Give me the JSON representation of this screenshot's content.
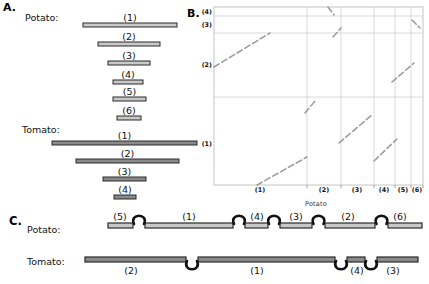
{
  "colors": {
    "potato_fill": "#c9c9c9",
    "tomato_fill": "#8a8a8a",
    "bar_outline": "#2a2a2a",
    "grid": "#d9d9d9",
    "frame": "#c4c4c4",
    "dash": "#999999",
    "loop": "#111111",
    "text": "#111111"
  },
  "panel_a": {
    "label": "A.",
    "potato_label": "Potato:",
    "tomato_label": "Tomato:",
    "bar_h": 4,
    "potato_bars": [
      {
        "label": "(1)",
        "x": 83,
        "w": 94,
        "y": 23
      },
      {
        "label": "(2)",
        "x": 98,
        "w": 62,
        "y": 42
      },
      {
        "label": "(3)",
        "x": 108,
        "w": 42,
        "y": 61
      },
      {
        "label": "(4)",
        "x": 113,
        "w": 30,
        "y": 80
      },
      {
        "label": "(5)",
        "x": 113,
        "w": 33,
        "y": 97
      },
      {
        "label": "(6)",
        "x": 117,
        "w": 24,
        "y": 116
      }
    ],
    "tomato_bars": [
      {
        "label": "(1)",
        "x": 52,
        "w": 145,
        "y": 141
      },
      {
        "label": "(2)",
        "x": 76,
        "w": 103,
        "y": 159
      },
      {
        "label": "(3)",
        "x": 103,
        "w": 43,
        "y": 177
      },
      {
        "label": "(4)",
        "x": 114,
        "w": 22,
        "y": 195
      }
    ]
  },
  "panel_b": {
    "label": "B.",
    "x_axis_label": "Potato",
    "plot": {
      "left": 214,
      "top": 7,
      "right": 423,
      "bottom": 185
    },
    "x_grid": [
      307,
      341,
      374,
      395,
      411
    ],
    "y_grid": [
      16,
      33,
      97
    ],
    "x_ticks": [
      {
        "label": "(1)",
        "x": 260
      },
      {
        "label": "(2)",
        "x": 324
      },
      {
        "label": "(3)",
        "x": 357
      },
      {
        "label": "(4)",
        "x": 384
      },
      {
        "label": "(5)",
        "x": 403
      },
      {
        "label": "(6)",
        "x": 417
      }
    ],
    "y_ticks": [
      {
        "label": "(4)",
        "y": 11
      },
      {
        "label": "(3)",
        "y": 24
      },
      {
        "label": "(2)",
        "y": 64
      },
      {
        "label": "(1)",
        "y": 143
      }
    ],
    "alignments": [
      {
        "x1": 214,
        "y1": 67,
        "x2": 270,
        "y2": 33,
        "orientation": "forward"
      },
      {
        "x1": 333,
        "y1": 37,
        "x2": 341,
        "y2": 28,
        "orientation": "forward"
      },
      {
        "x1": 328,
        "y1": 7,
        "x2": 334,
        "y2": 15,
        "orientation": "inverted"
      },
      {
        "x1": 412,
        "y1": 20,
        "x2": 420,
        "y2": 28,
        "orientation": "inverted"
      },
      {
        "x1": 392,
        "y1": 82,
        "x2": 414,
        "y2": 63,
        "orientation": "forward"
      },
      {
        "x1": 305,
        "y1": 113,
        "x2": 316,
        "y2": 100,
        "orientation": "forward"
      },
      {
        "x1": 339,
        "y1": 143,
        "x2": 373,
        "y2": 114,
        "orientation": "forward"
      },
      {
        "x1": 374,
        "y1": 161,
        "x2": 397,
        "y2": 139,
        "orientation": "forward"
      },
      {
        "x1": 257,
        "y1": 185,
        "x2": 307,
        "y2": 157,
        "orientation": "forward"
      }
    ]
  },
  "panel_c": {
    "label": "C.",
    "potato_label": "Potato:",
    "tomato_label": "Tomato:",
    "bar_h": 5,
    "potato": {
      "bar_y": 223,
      "label_baseline": 220,
      "segments": [
        {
          "label": "(5)",
          "x1": 108,
          "x2": 133,
          "label_x": 120
        },
        {
          "label": "(1)",
          "x1": 145,
          "x2": 233,
          "label_x": 189
        },
        {
          "label": "(4)",
          "x1": 245,
          "x2": 268,
          "label_x": 257
        },
        {
          "label": "(3)",
          "x1": 280,
          "x2": 312,
          "label_x": 296
        },
        {
          "label": "(2)",
          "x1": 325,
          "x2": 375,
          "label_x": 348
        },
        {
          "label": "(6)",
          "x1": 388,
          "x2": 422,
          "label_x": 400
        }
      ],
      "loops": [
        139,
        239,
        274,
        318.5,
        381.5
      ]
    },
    "tomato": {
      "bar_y": 257,
      "label_baseline": 274,
      "segments": [
        {
          "label": "(2)",
          "x1": 85,
          "x2": 186,
          "label_x": 131
        },
        {
          "label": "(1)",
          "x1": 198,
          "x2": 335,
          "label_x": 257
        },
        {
          "label": "(4)",
          "x1": 347,
          "x2": 365,
          "label_x": 357
        },
        {
          "label": "(3)",
          "x1": 377,
          "x2": 418,
          "label_x": 393
        }
      ],
      "loops": [
        192,
        341,
        371
      ]
    }
  },
  "chart_data": {
    "type": "scatter",
    "title": "",
    "xlabel": "Potato",
    "ylabel": "",
    "x_categories": [
      "(1)",
      "(2)",
      "(3)",
      "(4)",
      "(5)",
      "(6)"
    ],
    "y_categories": [
      "(1)",
      "(2)",
      "(3)",
      "(4)"
    ],
    "grid": true,
    "note": "Dot-plot of alignments between potato segments (x axis) and tomato segments (y axis); dashed positive-slope segments are collinear alignments, negative-slope segments are inversions",
    "alignment_pairs": [
      {
        "potato": "(1)",
        "tomato": "(2)",
        "slope": "+"
      },
      {
        "potato": "(2)",
        "tomato": "(3)",
        "slope": "+"
      },
      {
        "potato": "(2)",
        "tomato": "(4)",
        "slope": "-"
      },
      {
        "potato": "(6)",
        "tomato": "(3)",
        "slope": "-"
      },
      {
        "potato": "(5)-(6)",
        "tomato": "(2)",
        "slope": "+"
      },
      {
        "potato": "(2)",
        "tomato": "(1)",
        "slope": "+"
      },
      {
        "potato": "(3)",
        "tomato": "(1)",
        "slope": "+"
      },
      {
        "potato": "(4)",
        "tomato": "(1)",
        "slope": "+"
      },
      {
        "potato": "(1)",
        "tomato": "(1)",
        "slope": "+"
      }
    ]
  }
}
